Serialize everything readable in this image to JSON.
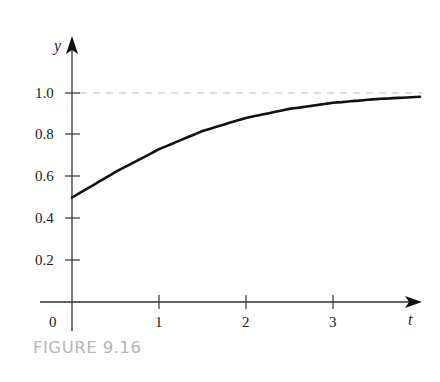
{
  "caption": "FIGURE 9.16",
  "chart_data": {
    "type": "line",
    "title": "",
    "xlabel": "t",
    "ylabel": "y",
    "x_ticks": [
      0,
      1,
      2,
      3
    ],
    "x_tick_labels": [
      "0",
      "1",
      "2",
      "3"
    ],
    "y_ticks": [
      0.2,
      0.4,
      0.6,
      0.8,
      1.0
    ],
    "y_tick_labels": [
      "0.2",
      "0.4",
      "0.6",
      "0.8",
      "1.0"
    ],
    "xlim": [
      0,
      4
    ],
    "ylim": [
      0,
      1.1
    ],
    "grid": false,
    "legend": null,
    "series": [
      {
        "name": "y(t)",
        "style": "solid",
        "color": "#111111",
        "x": [
          0,
          0.5,
          1,
          1.5,
          2,
          2.5,
          3,
          3.5,
          4
        ],
        "values": [
          0.5,
          0.622,
          0.731,
          0.818,
          0.881,
          0.924,
          0.953,
          0.971,
          0.982
        ]
      }
    ],
    "annotations": [
      {
        "type": "horizontal-dashed-line",
        "y": 1.0,
        "label": "asymptote y = 1",
        "color": "#b0b0b0"
      }
    ]
  }
}
